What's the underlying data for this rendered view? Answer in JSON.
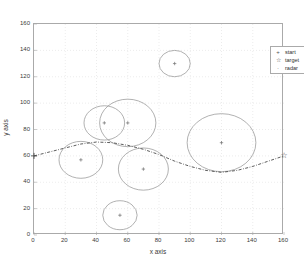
{
  "chart_data": {
    "type": "scatter",
    "title": "",
    "xlabel": "x axis",
    "ylabel": "y axis",
    "xlim": [
      0,
      160
    ],
    "ylim": [
      0,
      160
    ],
    "xticks": [
      0,
      20,
      40,
      60,
      80,
      100,
      120,
      140,
      160
    ],
    "yticks": [
      0,
      20,
      40,
      60,
      80,
      100,
      120,
      140,
      160
    ],
    "grid": true,
    "legend": {
      "position": "top-right",
      "entries": [
        {
          "marker": "+",
          "icon": "plus-marker-icon",
          "label": "start"
        },
        {
          "marker": "☆",
          "icon": "star-marker-icon",
          "label": "target"
        },
        {
          "marker": "·",
          "icon": "dot-marker-icon",
          "label": "radar"
        }
      ]
    },
    "start_point": {
      "x": 0,
      "y": 60,
      "marker": "+"
    },
    "target_point": {
      "x": 160,
      "y": 60,
      "marker": "☆"
    },
    "radars": [
      {
        "x": 90,
        "y": 130,
        "r": 10
      },
      {
        "x": 45,
        "y": 85,
        "r": 13
      },
      {
        "x": 60,
        "y": 85,
        "r": 18
      },
      {
        "x": 30,
        "y": 57,
        "r": 14
      },
      {
        "x": 70,
        "y": 50,
        "r": 16
      },
      {
        "x": 55,
        "y": 15,
        "r": 11
      },
      {
        "x": 120,
        "y": 70,
        "r": 22
      }
    ],
    "path": [
      [
        0,
        60
      ],
      [
        10,
        63
      ],
      [
        20,
        66
      ],
      [
        30,
        69
      ],
      [
        40,
        70.5
      ],
      [
        50,
        70
      ],
      [
        60,
        68
      ],
      [
        70,
        65
      ],
      [
        80,
        61
      ],
      [
        90,
        56
      ],
      [
        100,
        52
      ],
      [
        110,
        49
      ],
      [
        120,
        47.5
      ],
      [
        130,
        49
      ],
      [
        140,
        52
      ],
      [
        150,
        56
      ],
      [
        160,
        60
      ]
    ],
    "colors": {
      "circle": "#8f8f8f",
      "path": "#4a4a4a",
      "grid": "#d9d9d9",
      "axis": "#aaaaaa",
      "text": "#3a3a3a",
      "marker": "#6f6f6f"
    }
  }
}
